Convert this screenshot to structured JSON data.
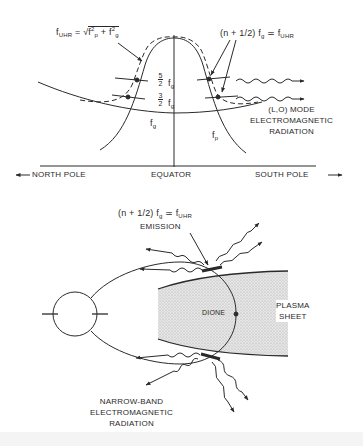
{
  "figure": {
    "top_panel": {
      "title_formula_left": {
        "f": "f",
        "sub": "UHR",
        "eq": " = √",
        "fp": "f",
        "fp_sub": "p",
        "fp_sup": "2",
        "plus": " + ",
        "fg": "f",
        "fg_sub": "g",
        "fg_sup": "2"
      },
      "title_formula_right": {
        "prefix": "(n + 1/2) f",
        "sub_g": "g",
        "approx": " ≃ f",
        "sub_uhr": "UHR"
      },
      "harmonics": [
        {
          "num": "5",
          "den": "2",
          "f": "f",
          "sub": "g"
        },
        {
          "num": "3",
          "den": "2",
          "f": "f",
          "sub": "g"
        }
      ],
      "curve_labels": {
        "fg": {
          "f": "f",
          "sub": "g"
        },
        "fp": {
          "f": "f",
          "sub": "p"
        }
      },
      "radiation_label": [
        "(L,O) MODE",
        "ELECTROMAGNETIC",
        "RADIATION"
      ],
      "axis": {
        "north": "NORTH POLE",
        "equator": "EQUATOR",
        "south": "SOUTH POLE",
        "north_arrow": "←",
        "south_arrow": "→"
      }
    },
    "bottom_panel": {
      "emission_formula": {
        "prefix": "(n + 1/2) f",
        "sub_g": "g",
        "approx": " ≃ f",
        "sub_uhr": "UHR"
      },
      "emission_label": "EMISSION",
      "moon_label": "DIONE",
      "sheet_label": [
        "PLASMA",
        "SHEET"
      ],
      "radiation_label": [
        "NARROW-BAND",
        "ELECTROMAGNETIC",
        "RADIATION"
      ]
    },
    "colors": {
      "ink": "#2a2a2a",
      "shade": "#d9d9d9",
      "background": "#ffffff"
    }
  }
}
